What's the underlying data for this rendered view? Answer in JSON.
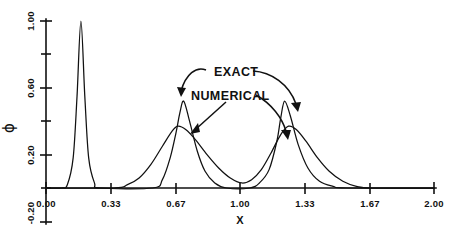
{
  "chart_data": {
    "type": "line",
    "title": "",
    "xlabel": "X",
    "ylabel": "ϕ",
    "xlim": [
      0.0,
      2.0
    ],
    "ylim": [
      -0.2,
      1.0
    ],
    "grid": false,
    "legend_position": "inline-annotation",
    "x_ticks": [
      {
        "value": 0.0,
        "label": "0.00"
      },
      {
        "value": 0.33,
        "label": "0.33"
      },
      {
        "value": 0.67,
        "label": "0.67"
      },
      {
        "value": 1.0,
        "label": "1.00"
      },
      {
        "value": 1.33,
        "label": "1.33"
      },
      {
        "value": 1.67,
        "label": "1.67"
      },
      {
        "value": 2.0,
        "label": "2.00"
      }
    ],
    "y_ticks": [
      {
        "value": 1.0,
        "label": "1.00"
      },
      {
        "value": 0.8,
        "label": ""
      },
      {
        "value": 0.6,
        "label": "0.60"
      },
      {
        "value": 0.4,
        "label": ""
      },
      {
        "value": 0.2,
        "label": "0.20"
      },
      {
        "value": 0.0,
        "label": "0.00"
      },
      {
        "value": -0.2,
        "label": "-0.20"
      }
    ],
    "annotations": [
      {
        "text": "EXACT",
        "x_px": 214,
        "y_px": 72,
        "target_curves": [
          "exact-left-peak",
          "exact-right-peak"
        ]
      },
      {
        "text": "NUMERICAL",
        "x_px": 191,
        "y_px": 96,
        "target_curves": [
          "numerical-left-peak",
          "numerical-right-peak"
        ]
      }
    ],
    "series": [
      {
        "name": "EXACT",
        "description": "Sharp narrow spike near x=0.18 reaching 1.00, plus two taller narrow peaks near x=0.71 and x=1.23 reaching about 0.52.",
        "peaks": [
          {
            "center": 0.18,
            "height": 1.0,
            "halfwidth": 0.055
          },
          {
            "center": 0.71,
            "height": 0.52,
            "halfwidth": 0.075
          },
          {
            "center": 1.23,
            "height": 0.52,
            "halfwidth": 0.075
          }
        ],
        "points": [
          {
            "x": 0.0,
            "y": 0.0
          },
          {
            "x": 0.08,
            "y": 0.0
          },
          {
            "x": 0.11,
            "y": 0.02
          },
          {
            "x": 0.14,
            "y": 0.18
          },
          {
            "x": 0.16,
            "y": 0.55
          },
          {
            "x": 0.18,
            "y": 1.0
          },
          {
            "x": 0.2,
            "y": 0.55
          },
          {
            "x": 0.22,
            "y": 0.18
          },
          {
            "x": 0.25,
            "y": 0.03
          },
          {
            "x": 0.28,
            "y": 0.0
          },
          {
            "x": 0.55,
            "y": 0.0
          },
          {
            "x": 0.6,
            "y": 0.05
          },
          {
            "x": 0.64,
            "y": 0.18
          },
          {
            "x": 0.67,
            "y": 0.33
          },
          {
            "x": 0.69,
            "y": 0.45
          },
          {
            "x": 0.71,
            "y": 0.52
          },
          {
            "x": 0.74,
            "y": 0.4
          },
          {
            "x": 0.78,
            "y": 0.22
          },
          {
            "x": 0.82,
            "y": 0.1
          },
          {
            "x": 0.87,
            "y": 0.03
          },
          {
            "x": 0.93,
            "y": 0.0
          },
          {
            "x": 1.05,
            "y": 0.0
          },
          {
            "x": 1.1,
            "y": 0.03
          },
          {
            "x": 1.15,
            "y": 0.11
          },
          {
            "x": 1.19,
            "y": 0.28
          },
          {
            "x": 1.21,
            "y": 0.42
          },
          {
            "x": 1.23,
            "y": 0.52
          },
          {
            "x": 1.26,
            "y": 0.43
          },
          {
            "x": 1.3,
            "y": 0.26
          },
          {
            "x": 1.35,
            "y": 0.12
          },
          {
            "x": 1.41,
            "y": 0.04
          },
          {
            "x": 1.48,
            "y": 0.01
          },
          {
            "x": 1.55,
            "y": 0.0
          },
          {
            "x": 2.0,
            "y": 0.0
          }
        ]
      },
      {
        "name": "NUMERICAL",
        "description": "Two broader, lower humps near x=0.68 and x=1.25 reaching about 0.37, with wider tails overlapping near x=1.00.",
        "peaks": [
          {
            "center": 0.68,
            "height": 0.37,
            "halfwidth": 0.135
          },
          {
            "center": 1.25,
            "height": 0.37,
            "halfwidth": 0.135
          }
        ],
        "points": [
          {
            "x": 0.0,
            "y": 0.0
          },
          {
            "x": 0.35,
            "y": 0.0
          },
          {
            "x": 0.42,
            "y": 0.02
          },
          {
            "x": 0.48,
            "y": 0.06
          },
          {
            "x": 0.54,
            "y": 0.14
          },
          {
            "x": 0.6,
            "y": 0.25
          },
          {
            "x": 0.65,
            "y": 0.34
          },
          {
            "x": 0.68,
            "y": 0.37
          },
          {
            "x": 0.72,
            "y": 0.35
          },
          {
            "x": 0.77,
            "y": 0.29
          },
          {
            "x": 0.83,
            "y": 0.2
          },
          {
            "x": 0.89,
            "y": 0.12
          },
          {
            "x": 0.95,
            "y": 0.06
          },
          {
            "x": 1.01,
            "y": 0.03
          },
          {
            "x": 1.06,
            "y": 0.05
          },
          {
            "x": 1.11,
            "y": 0.11
          },
          {
            "x": 1.16,
            "y": 0.21
          },
          {
            "x": 1.21,
            "y": 0.32
          },
          {
            "x": 1.25,
            "y": 0.37
          },
          {
            "x": 1.29,
            "y": 0.35
          },
          {
            "x": 1.34,
            "y": 0.28
          },
          {
            "x": 1.4,
            "y": 0.18
          },
          {
            "x": 1.46,
            "y": 0.1
          },
          {
            "x": 1.53,
            "y": 0.04
          },
          {
            "x": 1.6,
            "y": 0.01
          },
          {
            "x": 1.68,
            "y": 0.0
          },
          {
            "x": 2.0,
            "y": 0.0
          }
        ]
      }
    ]
  },
  "axes": {
    "x_title": "X",
    "y_title": "ϕ"
  },
  "colors": {
    "ink": "#111111",
    "background": "#ffffff"
  }
}
